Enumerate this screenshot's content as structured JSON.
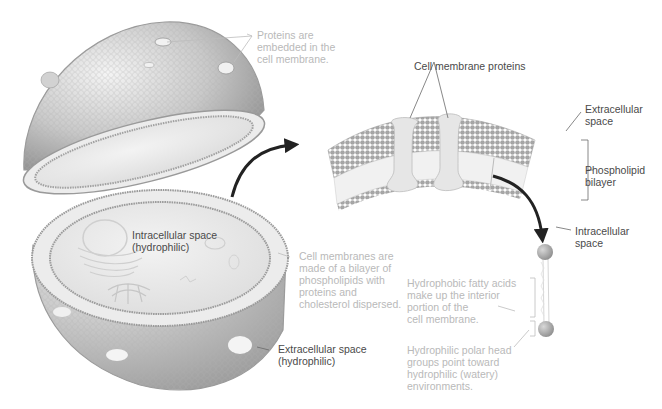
{
  "diagram": {
    "type": "biology-cell-membrane",
    "colors": {
      "background": "#ffffff",
      "membrane_gray": "#9a9a9a",
      "membrane_light": "#d8d8d8",
      "interior": "#e9e9e9",
      "arrow": "#222222",
      "dark_label": "#4a4a4a",
      "light_label": "#b9b9b9",
      "protein": "#e4e4e4"
    },
    "labels": {
      "proteins_embedded": "Proteins are\nembedded in the\ncell membrane.",
      "cell_membrane_proteins": "Cell membrane proteins",
      "extracellular_space_right": "Extracellular\nspace",
      "phospholipid_bilayer": "Phospholipid\nbilayer",
      "intracellular_space_right": "Intracellular\nspace",
      "intracellular_space_hydrophilic": "Intracellular space\n(hydrophilic)",
      "cell_membranes_made_of": "Cell membranes are\nmade of a bilayer of\nphospholipids with\nproteins and\ncholesterol dispersed.",
      "hydrophobic_fatty_acids": "Hydrophobic fatty acids\nmake up the interior\nportion of the\ncell membrane.",
      "hydrophilic_polar_heads": "Hydrophilic polar head\ngroups point toward\nhydrophilic (watery)\nenvironments.",
      "extracellular_space_hydrophilic": "Extracellular space\n(hydrophilic)"
    }
  }
}
